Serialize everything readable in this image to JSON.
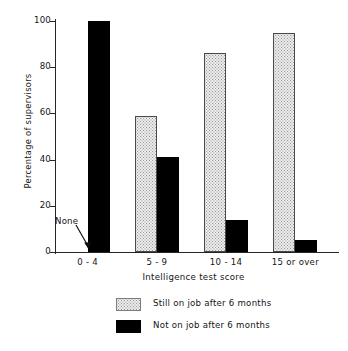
{
  "chart_data": {
    "type": "bar",
    "title": "",
    "xlabel": "Intelligence test score",
    "ylabel": "Percentage of supervisors",
    "categories": [
      "0 - 4",
      "5 - 9",
      "10 - 14",
      "15 or over"
    ],
    "series": [
      {
        "name": "Still on job after 6 months",
        "values": [
          0,
          59,
          86,
          95
        ],
        "color": "#ebebeb",
        "pattern": "stippled"
      },
      {
        "name": "Not on job after 6 months",
        "values": [
          100,
          41,
          14,
          5
        ],
        "color": "#000000",
        "pattern": "solid"
      }
    ],
    "ylim": [
      0,
      100
    ],
    "yticks": [
      0,
      20,
      40,
      60,
      80,
      100
    ],
    "ytick_labels": [
      "0",
      "20",
      "40",
      "60",
      "80",
      "100"
    ],
    "grid": false,
    "legend_position": "bottom",
    "annotations": [
      {
        "text": "None",
        "points_to_category": "0 - 4",
        "points_to_series": "Still on job after 6 months",
        "value": 0
      }
    ]
  },
  "axes": {
    "y_title": "Percentage of supervisors",
    "x_title": "Intelligence test score"
  },
  "legend": {
    "items": [
      {
        "label": "Still on job after 6 months",
        "swatch": "stippled-swatch"
      },
      {
        "label": "Not on job after 6 months",
        "swatch": "black-swatch"
      }
    ]
  },
  "annotation": {
    "none_label": "None"
  }
}
